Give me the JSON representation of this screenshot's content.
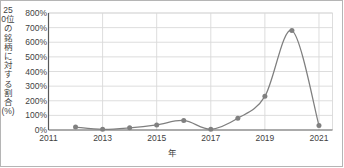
{
  "chart_data": {
    "type": "line",
    "title": "",
    "xlabel": "年",
    "ylabel": "250位の銘柄に対する割合(%)",
    "x": [
      2012,
      2013,
      2014,
      2015,
      2016,
      2017,
      2018,
      2019,
      2020,
      2021
    ],
    "values": [
      20,
      5,
      15,
      35,
      65,
      5,
      80,
      230,
      680,
      30
    ],
    "series": [
      {
        "name": "250位の銘柄に対する割合",
        "values": [
          20,
          5,
          15,
          35,
          65,
          5,
          80,
          230,
          680,
          30
        ]
      }
    ],
    "xlim": [
      2011,
      2021.5
    ],
    "ylim": [
      0,
      800
    ],
    "x_ticks": [
      "2011",
      "2013",
      "2015",
      "2017",
      "2019",
      "2021"
    ],
    "x_tick_values": [
      2011,
      2013,
      2015,
      2017,
      2019,
      2021
    ],
    "y_ticks": [
      "0%",
      "100%",
      "200%",
      "300%",
      "400%",
      "500%",
      "600%",
      "700%",
      "800%"
    ],
    "y_tick_values": [
      0,
      100,
      200,
      300,
      400,
      500,
      600,
      700,
      800
    ],
    "grid": "horizontal-and-vertical",
    "legend": "none",
    "marker": "filled-circle",
    "interpolation": "smooth-spline",
    "colors": {
      "line": "#7f7f7f",
      "marker": "#808080",
      "grid": "#d9d9d9",
      "axis": "#595959",
      "text": "#3f3f3f",
      "background": "#ffffff",
      "border": "#b5b5b5"
    }
  },
  "axis": {
    "y_title": "250位の銘柄に対する割合(%)",
    "x_title": "年"
  }
}
